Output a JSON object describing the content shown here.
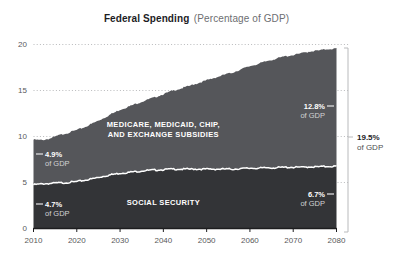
{
  "header": {
    "title_main": "Federal Spending",
    "title_sub": "(Percentage of GDP)"
  },
  "chart_data": {
    "type": "area",
    "stacked": true,
    "title": "Federal Spending (Percentage of GDP)",
    "xlabel": "",
    "ylabel": "",
    "xlim": [
      2010,
      2080
    ],
    "ylim": [
      0,
      20
    ],
    "grid": true,
    "grid_style": "dotted-horizontal",
    "legend": "inline-band-labels",
    "xticks": [
      "2010",
      "2020",
      "2030",
      "2040",
      "2050",
      "2060",
      "2070",
      "2080"
    ],
    "yticks": [
      "0",
      "5",
      "10",
      "15",
      "20"
    ],
    "x": [
      2010,
      2012,
      2014,
      2016,
      2018,
      2020,
      2022,
      2024,
      2026,
      2028,
      2030,
      2032,
      2034,
      2036,
      2038,
      2040,
      2042,
      2044,
      2046,
      2048,
      2050,
      2052,
      2054,
      2056,
      2058,
      2060,
      2062,
      2064,
      2066,
      2068,
      2070,
      2072,
      2074,
      2076,
      2078,
      2080
    ],
    "series": [
      {
        "name": "SOCIAL SECURITY",
        "color": "#333437",
        "label_x": 2040,
        "values": [
          4.7,
          4.8,
          4.85,
          4.9,
          4.95,
          5.05,
          5.2,
          5.4,
          5.6,
          5.8,
          5.95,
          6.05,
          6.15,
          6.25,
          6.3,
          6.35,
          6.4,
          6.4,
          6.4,
          6.4,
          6.4,
          6.4,
          6.4,
          6.4,
          6.45,
          6.5,
          6.5,
          6.55,
          6.55,
          6.6,
          6.6,
          6.6,
          6.65,
          6.65,
          6.7,
          6.7
        ]
      },
      {
        "name": "MEDICARE, MEDICAID, CHIP, AND EXCHANGE SUBSIDIES",
        "color": "#55565a",
        "label_x": 2040,
        "values": [
          4.9,
          4.75,
          4.9,
          5.2,
          5.4,
          5.6,
          5.8,
          6.05,
          6.3,
          6.6,
          6.9,
          7.15,
          7.4,
          7.65,
          7.9,
          8.2,
          8.5,
          8.75,
          9.05,
          9.35,
          9.65,
          9.95,
          10.25,
          10.5,
          10.8,
          11.1,
          11.35,
          11.6,
          11.85,
          12.05,
          12.2,
          12.4,
          12.55,
          12.65,
          12.75,
          12.8
        ]
      }
    ],
    "annotations": [
      {
        "name": "medicare-start",
        "value": "4.9%",
        "unit": "of GDP",
        "side": "left",
        "band": "medicare",
        "year": 2010
      },
      {
        "name": "social-security-start",
        "value": "4.7%",
        "unit": "of GDP",
        "side": "left",
        "band": "social-security",
        "year": 2010
      },
      {
        "name": "medicare-end",
        "value": "12.8%",
        "unit": "of GDP",
        "side": "right",
        "band": "medicare",
        "year": 2080
      },
      {
        "name": "social-security-end",
        "value": "6.7%",
        "unit": "of GDP",
        "side": "right",
        "band": "social-security",
        "year": 2080
      },
      {
        "name": "total-end",
        "value": "19.5%",
        "unit": "of GDP",
        "side": "outside-right",
        "band": "total",
        "year": 2080
      }
    ],
    "total_bracket": {
      "value": "19.5%",
      "unit": "of GDP"
    }
  },
  "axes": {
    "y_labels": [
      "20",
      "15",
      "10",
      "5",
      "0"
    ],
    "x_labels": [
      "2010",
      "2020",
      "2030",
      "2040",
      "2050",
      "2060",
      "2070",
      "2080"
    ]
  },
  "colors": {
    "background": "#ffffff",
    "social_security": "#333437",
    "medicare": "#55565a",
    "separator": "#ffffff",
    "grid": "#b9babc",
    "axis_text": "#58595b",
    "title": "#1d1d1f",
    "subtitle": "#6d6e71"
  }
}
